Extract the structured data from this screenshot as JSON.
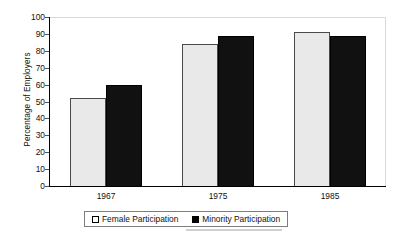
{
  "chart_data": {
    "type": "bar",
    "title": "",
    "xlabel": "",
    "ylabel": "Percentage of Employers",
    "categories": [
      "1967",
      "1975",
      "1985"
    ],
    "series": [
      {
        "name": "Female Participation",
        "values": [
          52,
          84,
          91
        ],
        "color": "#e9e9e9"
      },
      {
        "name": "Minority Participation",
        "values": [
          60,
          89,
          89
        ],
        "color": "#111111"
      }
    ],
    "ylim": [
      0,
      100
    ],
    "yticks": [
      "0",
      "10",
      "20",
      "30",
      "40",
      "50",
      "60",
      "70",
      "80",
      "90",
      "100"
    ],
    "grid": false,
    "legend_position": "bottom"
  },
  "axes": {
    "y_title": "Percentage of Employers"
  },
  "legend": {
    "entries": [
      {
        "label": "Female Participation",
        "swatch": "legend-swatch-female"
      },
      {
        "label": "Minority Participation",
        "swatch": "legend-swatch-minority"
      }
    ]
  }
}
